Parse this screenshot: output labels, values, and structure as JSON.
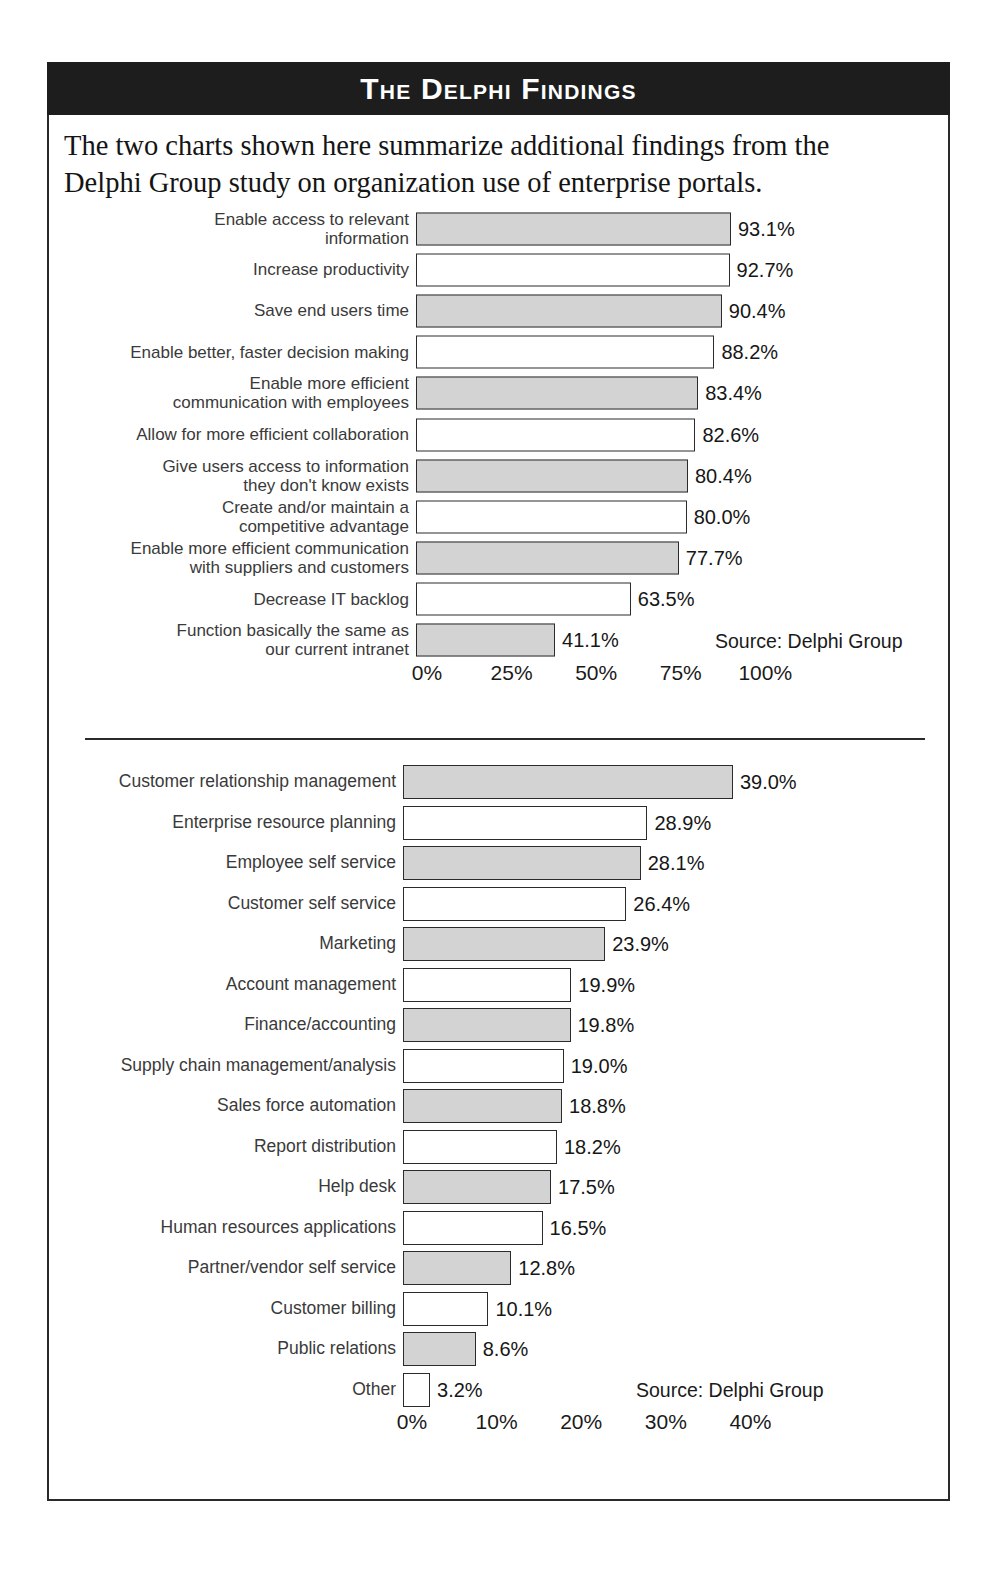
{
  "header": {
    "title": "The Delphi Findings"
  },
  "intro": {
    "line1": "The two charts shown here summarize additional findings from the",
    "line2": "Delphi Group study on organization use of enterprise portals."
  },
  "chart_data": [
    {
      "type": "bar",
      "orientation": "horizontal",
      "title": "",
      "xlabel": "",
      "ylabel": "",
      "xlim": [
        0,
        100
      ],
      "grid": false,
      "legend": false,
      "source": "Source: Delphi Group",
      "tick_labels": [
        "0%",
        "25%",
        "50%",
        "75%",
        "100%"
      ],
      "ticks": [
        0,
        25,
        50,
        75,
        100
      ],
      "categories": [
        "Enable access to relevant information",
        "Increase productivity",
        "Save end users time",
        "Enable better, faster decision making",
        "Enable more efficient communication with employees",
        "Allow for more efficient collaboration",
        "Give users access to information they don't know exists",
        "Create and/or maintain a competitive advantage",
        "Enable more efficient communication with suppliers and customers",
        "Decrease IT backlog",
        "Function basically the same as our current intranet"
      ],
      "category_lines": [
        [
          "Enable access to relevant",
          "information"
        ],
        [
          "Increase productivity"
        ],
        [
          "Save end users time"
        ],
        [
          "Enable better, faster decision making"
        ],
        [
          "Enable more efficient",
          "communication with employees"
        ],
        [
          "Allow for more efficient collaboration"
        ],
        [
          "Give users access to information",
          "they don't know exists"
        ],
        [
          "Create and/or maintain a",
          "competitive advantage"
        ],
        [
          "Enable more efficient communication",
          "with suppliers and customers"
        ],
        [
          "Decrease IT backlog"
        ],
        [
          "Function basically the same as",
          "our current intranet"
        ]
      ],
      "values": [
        93.1,
        92.7,
        90.4,
        88.2,
        83.4,
        82.6,
        80.4,
        80.0,
        77.7,
        63.5,
        41.1
      ],
      "value_labels": [
        "93.1%",
        "92.7%",
        "90.4%",
        "88.2%",
        "83.4%",
        "82.6%",
        "80.4%",
        "80.0%",
        "77.7%",
        "63.5%",
        "41.1%"
      ],
      "fills": [
        "shaded",
        "plain",
        "shaded",
        "plain",
        "shaded",
        "plain",
        "shaded",
        "plain",
        "shaded",
        "plain",
        "shaded"
      ]
    },
    {
      "type": "bar",
      "orientation": "horizontal",
      "title": "",
      "xlabel": "",
      "ylabel": "",
      "xlim": [
        0,
        40
      ],
      "grid": false,
      "legend": false,
      "source": "Source: Delphi Group",
      "tick_labels": [
        "0%",
        "10%",
        "20%",
        "30%",
        "40%"
      ],
      "ticks": [
        0,
        10,
        20,
        30,
        40
      ],
      "categories": [
        "Customer relationship management",
        "Enterprise resource planning",
        "Employee self service",
        "Customer self service",
        "Marketing",
        "Account management",
        "Finance/accounting",
        "Supply chain management/analysis",
        "Sales force automation",
        "Report distribution",
        "Help desk",
        "Human resources applications",
        "Partner/vendor self service",
        "Customer billing",
        "Public relations",
        "Other"
      ],
      "category_lines": [
        [
          "Customer relationship management"
        ],
        [
          "Enterprise resource planning"
        ],
        [
          "Employee self service"
        ],
        [
          "Customer self service"
        ],
        [
          "Marketing"
        ],
        [
          "Account management"
        ],
        [
          "Finance/accounting"
        ],
        [
          "Supply chain management/analysis"
        ],
        [
          "Sales force automation"
        ],
        [
          "Report distribution"
        ],
        [
          "Help desk"
        ],
        [
          "Human resources applications"
        ],
        [
          "Partner/vendor self service"
        ],
        [
          "Customer billing"
        ],
        [
          "Public relations"
        ],
        [
          "Other"
        ]
      ],
      "values": [
        39.0,
        28.9,
        28.1,
        26.4,
        23.9,
        19.9,
        19.8,
        19.0,
        18.8,
        18.2,
        17.5,
        16.5,
        12.8,
        10.1,
        8.6,
        3.2
      ],
      "value_labels": [
        "39.0%",
        "28.9%",
        "28.1%",
        "26.4%",
        "23.9%",
        "19.9%",
        "19.8%",
        "19.0%",
        "18.8%",
        "18.2%",
        "17.5%",
        "16.5%",
        "12.8%",
        "10.1%",
        "8.6%",
        "3.2%"
      ],
      "fills": [
        "shaded",
        "plain",
        "shaded",
        "plain",
        "shaded",
        "plain",
        "shaded",
        "plain",
        "shaded",
        "plain",
        "shaded",
        "plain",
        "shaded",
        "plain",
        "shaded",
        "plain"
      ]
    }
  ]
}
